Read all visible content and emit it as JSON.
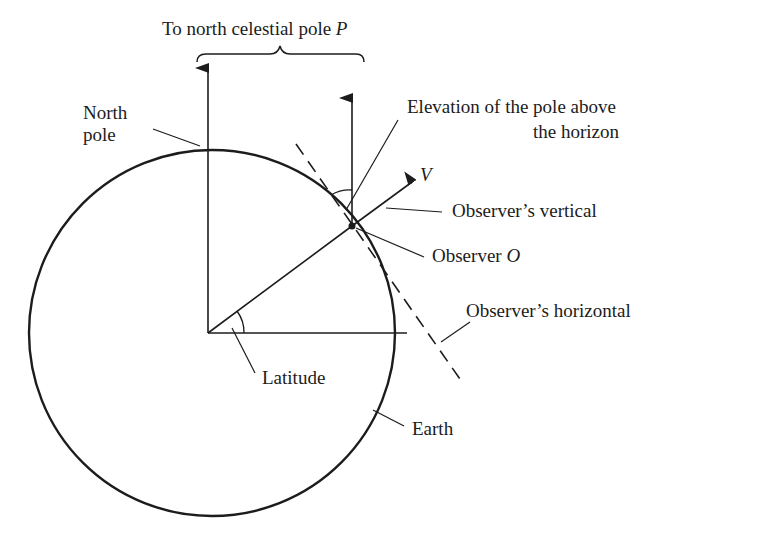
{
  "figure": {
    "type": "diagram",
    "colors": {
      "ink": "#1c1c1c",
      "background": "#ffffff",
      "bleed_text": "#d9d9d9"
    },
    "labels": {
      "top_prefix": "To north celestial pole ",
      "top_symbol": "P",
      "north_pole_line1": "North",
      "north_pole_line2": "pole",
      "elevation_line1": "Elevation of the pole above",
      "elevation_line2": "the horizon",
      "v_symbol": "V",
      "observers_vertical": "Observer’s vertical",
      "observer_prefix": "Observer ",
      "observer_symbol": "O",
      "observers_horizontal": "Observer’s horizontal",
      "latitude": "Latitude",
      "earth": "Earth"
    },
    "elements": [
      {
        "name": "earth-circle",
        "kind": "circle"
      },
      {
        "name": "polar-axis-arrow",
        "kind": "arrow",
        "points_to": "P"
      },
      {
        "name": "observer-pole-direction-arrow",
        "kind": "arrow",
        "points_to": "P"
      },
      {
        "name": "observer-vertical-arrow",
        "kind": "arrow",
        "label": "V"
      },
      {
        "name": "observer-horizontal",
        "kind": "dashed-line"
      },
      {
        "name": "equatorial-radius",
        "kind": "line"
      },
      {
        "name": "latitude-angle-arc",
        "kind": "arc"
      },
      {
        "name": "elevation-angle-arc",
        "kind": "arc"
      },
      {
        "name": "brace",
        "kind": "curly-brace"
      }
    ]
  },
  "bleed_through": {
    "lines": [
      "ample, at the Arabic ... nothe ... at po",
      "for the ... of Figure 12",
      "Pole Altitude and the Equinoctial",
      "besides the magnitude that were ... from",
      "there are ... quite simply",
      "Although the elevation ... from the horizon",
      "Wade ... using ... vertical",
      "... the length of the shadow",
      "astronomical ... measuring",
      "... through the ... though",
      "... the ... mentioned ... the",
      "The ... celestial ... to place"
    ]
  }
}
